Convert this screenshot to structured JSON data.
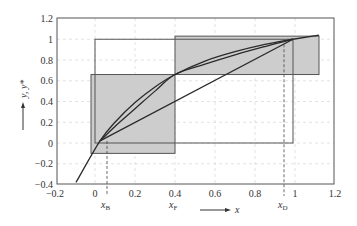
{
  "chart_data": {
    "type": "line",
    "title": "",
    "xlabel": "x",
    "ylabel": "y, y*",
    "xlim": [
      -0.2,
      1.2
    ],
    "ylim": [
      -0.4,
      1.2
    ],
    "grid": true,
    "x_ticks": [
      "−0.2",
      "0",
      "0.2",
      "0.4",
      "0.6",
      "0.8",
      "1",
      "1.2"
    ],
    "x_tick_values": [
      -0.2,
      0,
      0.2,
      0.4,
      0.6,
      0.8,
      1.0,
      1.2
    ],
    "y_ticks": [
      "−0.4",
      "−0.2",
      "0",
      "0.2",
      "0.4",
      "0.6",
      "0.8",
      "1",
      "1.2"
    ],
    "y_tick_values": [
      -0.4,
      -0.2,
      0,
      0.2,
      0.4,
      0.6,
      0.8,
      1.0,
      1.2
    ],
    "series": [
      {
        "name": "equilibrium-curve",
        "type": "curve",
        "x": [
          -0.095,
          0.025,
          0.1,
          0.2,
          0.3,
          0.4,
          0.55,
          0.7,
          0.85,
          0.99
        ],
        "y": [
          -0.38,
          0.02,
          0.2,
          0.39,
          0.54,
          0.66,
          0.79,
          0.88,
          0.95,
          1.0
        ]
      },
      {
        "name": "operating-curve",
        "type": "curve",
        "x": [
          0.025,
          0.1,
          0.2,
          0.3,
          0.4,
          0.55,
          0.7,
          0.85,
          0.99
        ],
        "y": [
          0.02,
          0.16,
          0.33,
          0.5,
          0.66,
          0.76,
          0.85,
          0.93,
          1.0
        ]
      },
      {
        "name": "diagonal-line",
        "type": "line",
        "x": [
          0.025,
          0.99
        ],
        "y": [
          0.02,
          1.0
        ]
      },
      {
        "name": "extension-line",
        "type": "line",
        "x": [
          0.99,
          1.12
        ],
        "y": [
          1.0,
          1.04
        ]
      }
    ],
    "rectangles": [
      {
        "name": "outer-box",
        "x0": 0.0,
        "y0": 0.0,
        "x1": 0.99,
        "y1": 1.0,
        "fill": "none"
      },
      {
        "name": "shaded-box-lower",
        "x0": -0.02,
        "y0": -0.1,
        "x1": 0.4,
        "y1": 0.66,
        "fill": "#c8c8c8"
      },
      {
        "name": "shaded-box-upper",
        "x0": 0.4,
        "y0": 0.66,
        "x1": 1.12,
        "y1": 1.03,
        "fill": "#c8c8c8"
      }
    ],
    "annotations": [
      {
        "label": "x",
        "sub": "B",
        "x": 0.06,
        "dashed_to_y": 0.02
      },
      {
        "label": "x",
        "sub": "F",
        "x": 0.4
      },
      {
        "label": "x",
        "sub": "D",
        "x": 0.945,
        "dashed_to_y": 1.0
      }
    ],
    "x_axis_arrow_label": "x",
    "y_axis_arrow_label": "y, y*"
  },
  "labels": {
    "x_axis": "x",
    "y_axis": "y, y*",
    "xB_main": "x",
    "xB_sub": "B",
    "xF_main": "x",
    "xF_sub": "F",
    "xD_main": "x",
    "xD_sub": "D"
  },
  "colors": {
    "shade": "#c8c8c8",
    "line": "#2a2a2a",
    "frame": "#555555",
    "grid": "#d0d0d0"
  }
}
